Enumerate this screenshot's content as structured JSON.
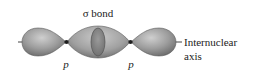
{
  "figure": {
    "title_label": "σ bond",
    "axis_label_line1": "Internuclear",
    "axis_label_line2": "axis",
    "orbital_labels": [
      "p",
      "p"
    ],
    "colors": {
      "lobe_fill": "#9a9a9a",
      "lobe_highlight": "#c4c4c4",
      "lobe_shadow": "#6e6e6e",
      "node": "#222222",
      "axis_line": "#444444",
      "ring": "#7c7c7c"
    }
  }
}
